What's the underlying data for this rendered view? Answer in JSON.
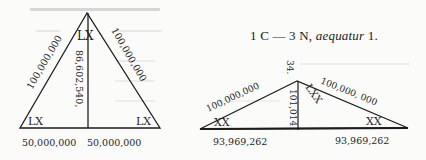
{
  "page": {
    "type": "scanned-book-page",
    "background_color": "#fbfbfa",
    "ink_color": "#1c1c1c"
  },
  "heading": {
    "prefix": "1 C — 3 N, ",
    "italic": "aequatur",
    "suffix": " 1."
  },
  "diagrams": [
    {
      "id": "left-triangle",
      "kind": "isosceles-triangle-with-altitude",
      "apex_angle_label": "LX",
      "base_left_angle_label": "LX",
      "base_right_angle_label": "LX",
      "left_side_label": "100,000,000",
      "right_side_label": "100,000,000",
      "altitude_label": "86,602,540,",
      "base_left_label": "50,000,000",
      "base_right_label": "50,000,000"
    },
    {
      "id": "right-triangle",
      "kind": "isosceles-triangle-with-altitude",
      "apex_top_label": "34.",
      "apex_angle_label": "LXX",
      "base_left_angle_label": "XX",
      "base_right_angle_label": "XX",
      "left_side_label": "100,000,000",
      "right_side_label": "100,000, 000",
      "altitude_label": "101,014",
      "base_left_label": "93,969,262",
      "base_right_label": "93,969,262"
    }
  ]
}
